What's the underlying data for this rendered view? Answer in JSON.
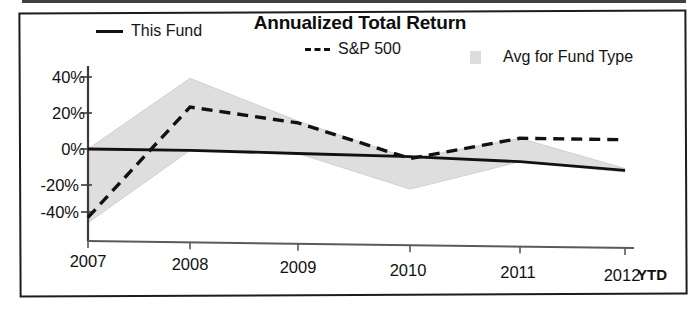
{
  "chart_data": {
    "type": "line",
    "title": "Annualized Total Return",
    "xlabel": "",
    "ylabel": "",
    "ylim": [
      -48,
      45
    ],
    "ytick_labels": [
      "40%",
      "20%",
      "0%",
      "-20%",
      "-40%"
    ],
    "ytick_values": [
      40,
      20,
      0,
      -20,
      -40
    ],
    "categories": [
      "2007",
      "2008",
      "2009",
      "2010",
      "2011",
      "2012"
    ],
    "x_axis_note": "YTD",
    "grid": false,
    "legend_position": "top",
    "series": [
      {
        "name": "This Fund",
        "style": "solid",
        "color": "#111111",
        "values": [
          0,
          0,
          -1,
          -2,
          -4,
          -8
        ]
      },
      {
        "name": "S&P 500",
        "style": "dashed",
        "color": "#111111",
        "values": [
          -38,
          24,
          16,
          -3,
          9,
          9
        ]
      },
      {
        "name": "Avg for Fund Type",
        "style": "band",
        "color": "#dcdcdc",
        "band_upper": [
          0,
          40,
          17,
          -3,
          9,
          -7
        ],
        "band_lower": [
          -41,
          0,
          -1,
          -20,
          -4,
          -9
        ]
      }
    ]
  },
  "chart": {
    "title": "Annualized Total Return",
    "ytd_label": "YTD"
  },
  "legend": {
    "items": [
      {
        "label": "This Fund",
        "swatch": "solid-line-swatch"
      },
      {
        "label": "S&P 500",
        "swatch": "dashed-line-swatch"
      },
      {
        "label": "Avg for Fund Type",
        "swatch": "shaded-area-swatch"
      }
    ]
  },
  "axes": {
    "y_ticks": [
      "40%",
      "20%",
      "0%",
      "-20%",
      "-40%"
    ],
    "x_ticks": [
      "2007",
      "2008",
      "2009",
      "2010",
      "2011",
      "2012"
    ]
  }
}
